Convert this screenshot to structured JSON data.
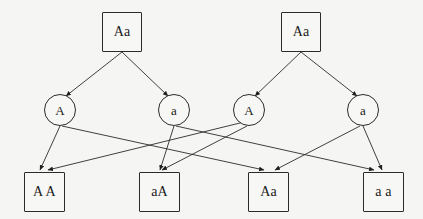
{
  "diagram": {
    "background_color": "#f5f5f4",
    "stroke_color": "#2b2b2b",
    "text_color": "#1a1a1a",
    "width": 423,
    "height": 219,
    "parents": [
      {
        "id": "parent-left",
        "label": "Aa",
        "x": 102,
        "y": 12,
        "w": 40,
        "h": 40
      },
      {
        "id": "parent-right",
        "label": "Aa",
        "x": 281,
        "y": 12,
        "w": 40,
        "h": 40
      }
    ],
    "gametes": [
      {
        "id": "gamete-1",
        "label": "A",
        "cx": 60,
        "cy": 110,
        "r": 16
      },
      {
        "id": "gamete-2",
        "label": "a",
        "cx": 174,
        "cy": 110,
        "r": 16
      },
      {
        "id": "gamete-3",
        "label": "A",
        "cx": 249,
        "cy": 110,
        "r": 16
      },
      {
        "id": "gamete-4",
        "label": "a",
        "cx": 363,
        "cy": 110,
        "r": 16
      }
    ],
    "offspring": [
      {
        "id": "offspring-1",
        "label": "A A",
        "x": 24,
        "y": 172,
        "w": 41,
        "h": 40
      },
      {
        "id": "offspring-2",
        "label": "aA",
        "x": 139,
        "y": 172,
        "w": 41,
        "h": 40
      },
      {
        "id": "offspring-3",
        "label": "Aa",
        "x": 248,
        "y": 172,
        "w": 41,
        "h": 40
      },
      {
        "id": "offspring-4",
        "label": "a a",
        "x": 363,
        "y": 172,
        "w": 41,
        "h": 40
      }
    ],
    "edges": [
      {
        "id": "edge-parentL-gameteA",
        "from": "parent-left",
        "to": "gamete-1",
        "x1": 122,
        "y1": 52,
        "x2": 66,
        "y2": 96
      },
      {
        "id": "edge-parentL-gamete_a",
        "from": "parent-left",
        "to": "gamete-2",
        "x1": 122,
        "y1": 52,
        "x2": 168,
        "y2": 96
      },
      {
        "id": "edge-parentR-gameteA",
        "from": "parent-right",
        "to": "gamete-3",
        "x1": 301,
        "y1": 52,
        "x2": 255,
        "y2": 96
      },
      {
        "id": "edge-parentR-gamete_a",
        "from": "parent-right",
        "to": "gamete-4",
        "x1": 301,
        "y1": 52,
        "x2": 357,
        "y2": 96
      },
      {
        "id": "edge-g1-o1",
        "from": "gamete-1",
        "to": "offspring-1",
        "x1": 60,
        "y1": 126,
        "x2": 40,
        "y2": 170
      },
      {
        "id": "edge-g1-o3",
        "from": "gamete-1",
        "to": "offspring-3",
        "x1": 62,
        "y1": 126,
        "x2": 264,
        "y2": 170
      },
      {
        "id": "edge-g2-o2",
        "from": "gamete-2",
        "to": "offspring-2",
        "x1": 174,
        "y1": 126,
        "x2": 160,
        "y2": 170
      },
      {
        "id": "edge-g2-o4",
        "from": "gamete-2",
        "to": "offspring-4",
        "x1": 176,
        "y1": 126,
        "x2": 374,
        "y2": 170
      },
      {
        "id": "edge-g3-o2",
        "from": "gamete-3",
        "to": "offspring-2",
        "x1": 247,
        "y1": 126,
        "x2": 162,
        "y2": 170
      },
      {
        "id": "edge-g3-o1",
        "from": "gamete-3",
        "to": "offspring-1",
        "x1": 244,
        "y1": 122,
        "x2": 48,
        "y2": 170
      },
      {
        "id": "edge-g4-o4",
        "from": "gamete-4",
        "to": "offspring-4",
        "x1": 363,
        "y1": 126,
        "x2": 382,
        "y2": 170
      },
      {
        "id": "edge-g4-o3",
        "from": "gamete-4",
        "to": "offspring-3",
        "x1": 360,
        "y1": 126,
        "x2": 275,
        "y2": 170
      }
    ]
  }
}
